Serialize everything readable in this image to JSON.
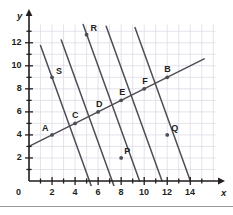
{
  "figure": {
    "background_color": "#ffffff",
    "grid_color": "#dedbe6",
    "line_color": "#4d4d55",
    "axis_color": "#231f20",
    "label_color": "#231f20",
    "divider_color": "#9a9a9a"
  },
  "axes": {
    "x_name": "x",
    "y_name": "y",
    "origin_label": "0",
    "x_ticks": [
      "2",
      "4",
      "6",
      "8",
      "10",
      "12",
      "14"
    ],
    "y_ticks": [
      "2",
      "4",
      "6",
      "8",
      "10",
      "12"
    ],
    "x_range": [
      0,
      15.5
    ],
    "y_range": [
      0,
      13.5
    ]
  },
  "chart_data": {
    "type": "scatter",
    "title": "",
    "xlabel": "x",
    "ylabel": "y",
    "xlim": [
      0,
      15.5
    ],
    "ylim": [
      0,
      13.5
    ],
    "x_ticks": [
      2,
      4,
      6,
      8,
      10,
      12,
      14
    ],
    "y_ticks": [
      2,
      4,
      6,
      8,
      10,
      12
    ],
    "grid": true,
    "legend": "none",
    "points": [
      {
        "label": "A",
        "x": 2,
        "y": 4
      },
      {
        "label": "C",
        "x": 4,
        "y": 5
      },
      {
        "label": "D",
        "x": 6,
        "y": 6
      },
      {
        "label": "E",
        "x": 8,
        "y": 7
      },
      {
        "label": "F",
        "x": 10,
        "y": 8
      },
      {
        "label": "B",
        "x": 12,
        "y": 9
      },
      {
        "label": "S",
        "x": 2,
        "y": 9
      },
      {
        "label": "R",
        "x": 5,
        "y": 12.7
      },
      {
        "label": "P",
        "x": 8,
        "y": 2
      },
      {
        "label": "Q",
        "x": 12,
        "y": 4
      }
    ],
    "lines": [
      {
        "name": "rising-line",
        "slope": 0.5,
        "intercept": 3,
        "x_start": 0,
        "x_end": 15.2,
        "passes_through": [
          "A",
          "C",
          "D",
          "E",
          "F",
          "B"
        ]
      },
      {
        "name": "transversal-1",
        "slope": -2.77,
        "intercept": 14.54,
        "x_start": 1.0,
        "x_end": 6.5,
        "passes_through": [
          "S"
        ]
      },
      {
        "name": "transversal-2",
        "slope": -2.77,
        "intercept": 20.0,
        "x_start": 2.8,
        "x_end": 8.6,
        "passes_through": [
          "C"
        ]
      },
      {
        "name": "transversal-3",
        "slope": -2.77,
        "intercept": 26.6,
        "x_start": 4.7,
        "x_end": 9.6,
        "passes_through": [
          "R",
          "D",
          "P"
        ]
      },
      {
        "name": "transversal-4",
        "slope": -2.77,
        "intercept": 32.0,
        "x_start": 6.7,
        "x_end": 11.55,
        "passes_through": [
          "E"
        ]
      },
      {
        "name": "transversal-5",
        "slope": -2.77,
        "intercept": 38.8,
        "x_start": 9.2,
        "x_end": 14.0,
        "passes_through": [
          "F",
          "Q"
        ]
      }
    ]
  }
}
